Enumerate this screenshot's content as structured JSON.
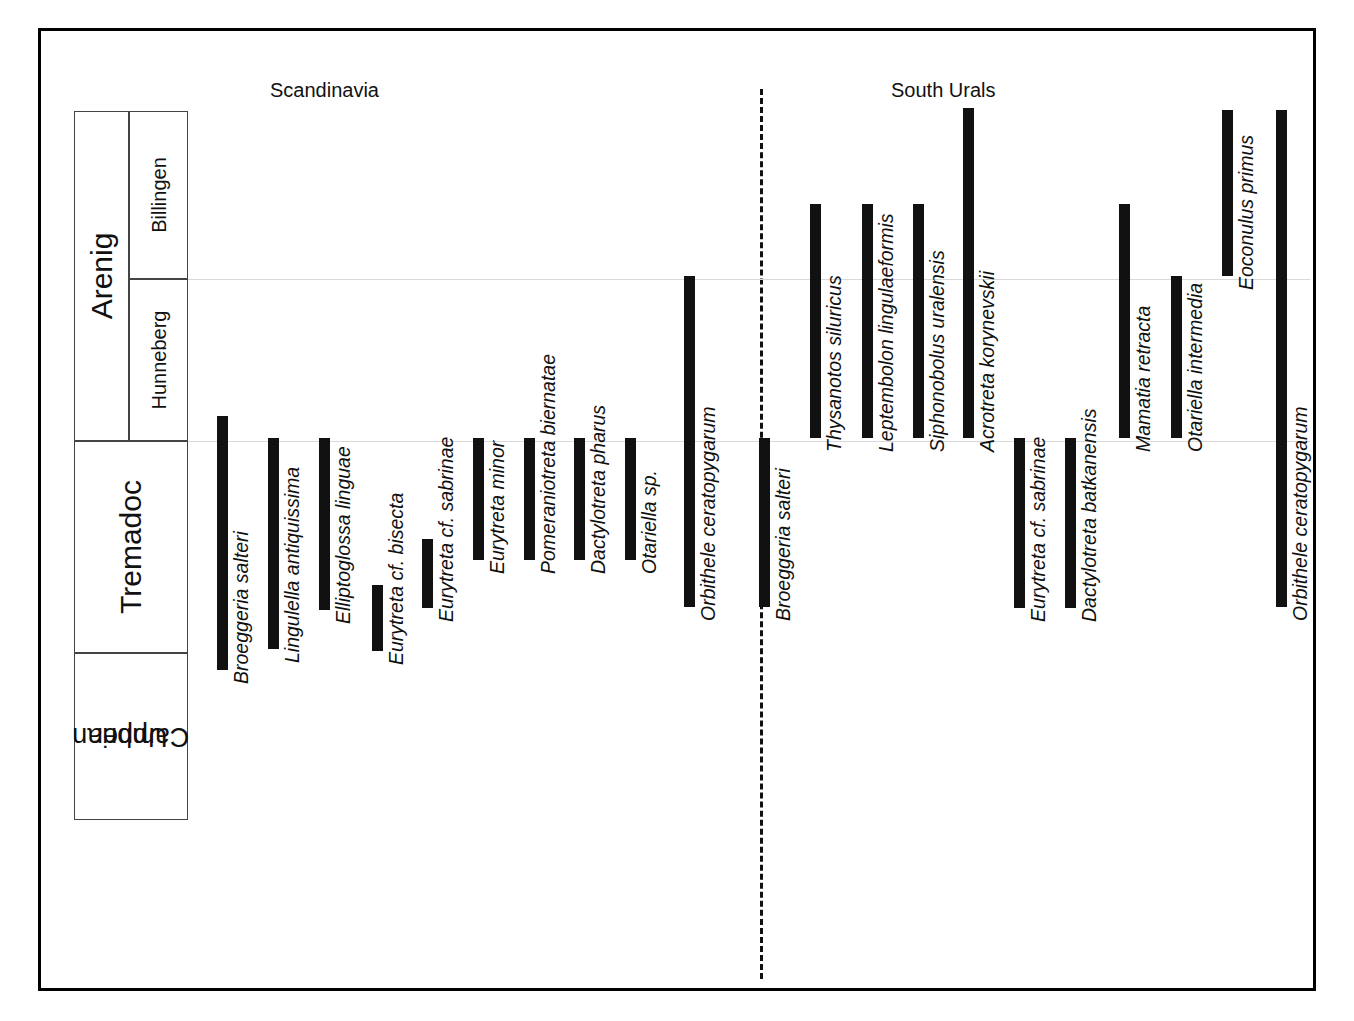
{
  "figure": {
    "type": "stratigraphic-range-chart",
    "regions": [
      {
        "name": "scandinavia",
        "label": "Scandinavia"
      },
      {
        "name": "south-urals",
        "label": "South  Urals"
      }
    ],
    "stratigraphy": {
      "series": [
        {
          "label": "Arenig",
          "top": 108,
          "bottom": 438
        },
        {
          "label": "Tremadoc",
          "top": 438,
          "bottom": 650
        },
        {
          "label": "Upper\nCambrian",
          "label_line1": "Upper",
          "label_line2": "Cambrian",
          "top": 650,
          "bottom": 817
        }
      ],
      "stages": [
        {
          "label": "Billingen",
          "top": 108,
          "bottom": 276
        },
        {
          "label": "Hunneberg",
          "top": 276,
          "bottom": 438
        }
      ],
      "boundary_lines": [
        276,
        438
      ]
    }
  },
  "chart_data": {
    "type": "range-bar",
    "title": "",
    "xlabel": "",
    "ylabel": "",
    "axis_categories": [
      "Billingen",
      "Hunneberg",
      "Tremadoc",
      "Upper Cambrian"
    ],
    "axis_series": [
      "Arenig",
      "Tremadoc",
      "Upper Cambrian"
    ],
    "legend": [],
    "grid": true,
    "series": [
      {
        "name": "Scandinavia",
        "taxa": [
          {
            "label": "Broeggeria salteri",
            "x": 217,
            "top": 416,
            "bottom": 670,
            "range_from": "Tremadoc",
            "range_to": "Upper Cambrian"
          },
          {
            "label": "Lingulella antiquissima",
            "x": 268,
            "top": 438,
            "bottom": 649,
            "range_from": "Tremadoc",
            "range_to": "Upper Cambrian"
          },
          {
            "label": "Elliptoglossa linguae",
            "x": 319,
            "top": 438,
            "bottom": 610,
            "range_from": "Tremadoc",
            "range_to": "Tremadoc"
          },
          {
            "label": "Eurytreta cf. bisecta",
            "x": 372,
            "top": 585,
            "bottom": 651,
            "range_from": "Tremadoc",
            "range_to": "Tremadoc"
          },
          {
            "label": "Eurytreta cf. sabrinae",
            "x": 422,
            "top": 539,
            "bottom": 608,
            "range_from": "Tremadoc",
            "range_to": "Tremadoc"
          },
          {
            "label": "Eurytreta minor",
            "x": 473,
            "top": 438,
            "bottom": 560,
            "range_from": "Tremadoc",
            "range_to": "Tremadoc"
          },
          {
            "label": "Pomeraniotreta biernatae",
            "x": 524,
            "top": 438,
            "bottom": 560,
            "range_from": "Tremadoc",
            "range_to": "Tremadoc"
          },
          {
            "label": "Dactylotreta pharus",
            "x": 574,
            "top": 438,
            "bottom": 560,
            "range_from": "Tremadoc",
            "range_to": "Tremadoc"
          },
          {
            "label": "Otariella sp.",
            "x": 625,
            "top": 438,
            "bottom": 560,
            "range_from": "Tremadoc",
            "range_to": "Tremadoc"
          },
          {
            "label": "Orbithele ceratopygarum",
            "x": 684,
            "top": 276,
            "bottom": 607,
            "range_from": "Hunneberg",
            "range_to": "Tremadoc"
          }
        ]
      },
      {
        "name": "South Urals",
        "taxa": [
          {
            "label": "Broeggeria salteri",
            "x": 759,
            "top": 438,
            "bottom": 607,
            "range_from": "Tremadoc",
            "range_to": "Tremadoc"
          },
          {
            "label": "Thysanotos siluricus",
            "x": 810,
            "top": 204,
            "bottom": 438,
            "range_from": "Billingen",
            "range_to": "Hunneberg"
          },
          {
            "label": "Leptembolon lingulaeformis",
            "x": 862,
            "top": 204,
            "bottom": 438,
            "range_from": "Billingen",
            "range_to": "Hunneberg"
          },
          {
            "label": "Siphonobolus uralensis",
            "x": 913,
            "top": 204,
            "bottom": 438,
            "range_from": "Billingen",
            "range_to": "Hunneberg"
          },
          {
            "label": "Acrotreta korynevskii",
            "x": 963,
            "top": 108,
            "bottom": 438,
            "range_from": "Billingen",
            "range_to": "Hunneberg"
          },
          {
            "label": "Eurytreta cf. sabrinae",
            "x": 1014,
            "top": 438,
            "bottom": 608,
            "range_from": "Tremadoc",
            "range_to": "Tremadoc"
          },
          {
            "label": "Dactylotreta batkanensis",
            "x": 1065,
            "top": 438,
            "bottom": 608,
            "range_from": "Tremadoc",
            "range_to": "Tremadoc"
          },
          {
            "label": "Mamatia retracta",
            "x": 1119,
            "top": 204,
            "bottom": 438,
            "range_from": "Billingen",
            "range_to": "Hunneberg"
          },
          {
            "label": "Otariella intermedia",
            "x": 1171,
            "top": 276,
            "bottom": 438,
            "range_from": "Hunneberg",
            "range_to": "Hunneberg"
          },
          {
            "label": "Eoconulus primus",
            "x": 1222,
            "top": 110,
            "bottom": 276,
            "range_from": "Billingen",
            "range_to": "Billingen"
          },
          {
            "label": "Orbithele ceratopygarum",
            "x": 1276,
            "top": 110,
            "bottom": 607,
            "range_from": "Billingen",
            "range_to": "Tremadoc"
          }
        ]
      }
    ]
  }
}
